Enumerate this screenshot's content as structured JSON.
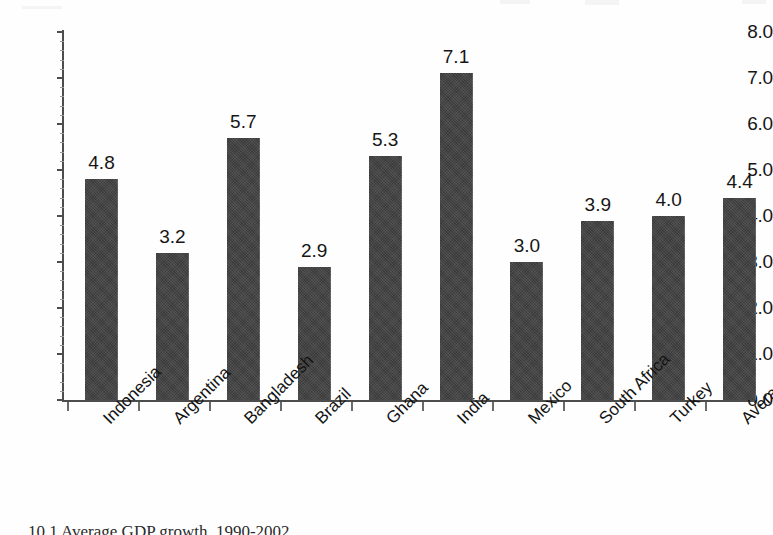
{
  "figure": {
    "background_color": "#fefefe",
    "bar_color": "#3a3a3a",
    "axis_color": "#4d4d4d",
    "text_color": "#161616",
    "caption": "10.1 Average GDP growth, 1990-2002"
  },
  "chart_data": {
    "type": "bar",
    "title": "",
    "subtitle": "",
    "xlabel": "",
    "ylabel": "",
    "categories": [
      "Indonesia",
      "Argentina",
      "Bangladesh",
      "Brazil",
      "Ghana",
      "India",
      "Mexico",
      "South Africa",
      "Turkey",
      "Average"
    ],
    "values": [
      4.8,
      3.2,
      5.7,
      2.9,
      5.3,
      7.1,
      3.0,
      3.9,
      4.0,
      4.4
    ],
    "value_labels": [
      "4.8",
      "3.2",
      "5.7",
      "2.9",
      "5.3",
      "7.1",
      "3.0",
      "3.9",
      "4.0",
      "4.4"
    ],
    "ylim": [
      0.0,
      8.0
    ],
    "ytick_labels": [
      "8.0",
      "7.0",
      "6.0",
      "5.0",
      "4.0",
      "3.0",
      "2.0",
      "1.0",
      "0.0"
    ],
    "ytick_values": [
      8.0,
      7.0,
      6.0,
      5.0,
      4.0,
      3.0,
      2.0,
      1.0,
      0.0
    ],
    "ytick_interval": 1.0,
    "grid": false,
    "legend": "none",
    "data_labels": true,
    "xtick_label_rotation": -45
  }
}
